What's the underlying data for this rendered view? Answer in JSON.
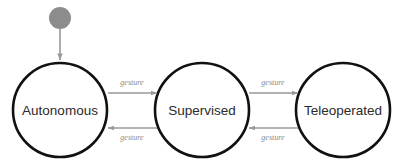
{
  "diagram": {
    "type": "state-machine",
    "title": "",
    "background_color": "#ffffff",
    "state_border_color": "#111111",
    "state_fill_color": "#ffffff",
    "state_label_color": "#2b2b2b",
    "edge_color": "#999999",
    "edge_label_color": "#8a8a8a",
    "initial_marker_color": "#8c8c8c",
    "states": [
      {
        "id": "autonomous",
        "label": "Autonomous",
        "cx": 60,
        "cy": 110,
        "r": 47
      },
      {
        "id": "supervised",
        "label": "Supervised",
        "cx": 202,
        "cy": 110,
        "r": 47
      },
      {
        "id": "teleoperated",
        "label": "Teleoperated",
        "cx": 343,
        "cy": 110,
        "r": 47
      }
    ],
    "initial_marker": {
      "label": "initial-state",
      "cx": 60,
      "cy": 18,
      "r": 11,
      "arrow_from_y": 29,
      "arrow_to_y": 62
    },
    "transitions": [
      {
        "id": "autonomous-to-supervised",
        "label": "gesture",
        "from": "autonomous",
        "to": "supervised",
        "direction": "right",
        "y": 93,
        "x1": 108,
        "x2": 157,
        "label_x": 132,
        "label_y": 83
      },
      {
        "id": "supervised-to-autonomous",
        "label": "gesture",
        "from": "supervised",
        "to": "autonomous",
        "direction": "left",
        "y": 128,
        "x1": 157,
        "x2": 108,
        "label_x": 132,
        "label_y": 138
      },
      {
        "id": "supervised-to-teleoperated",
        "label": "gesture",
        "from": "supervised",
        "to": "teleoperated",
        "direction": "right",
        "y": 93,
        "x1": 249,
        "x2": 298,
        "label_x": 273,
        "label_y": 83
      },
      {
        "id": "teleoperated-to-supervised",
        "label": "gesture",
        "from": "teleoperated",
        "to": "supervised",
        "direction": "left",
        "y": 128,
        "x1": 298,
        "x2": 249,
        "label_x": 273,
        "label_y": 138
      }
    ]
  }
}
